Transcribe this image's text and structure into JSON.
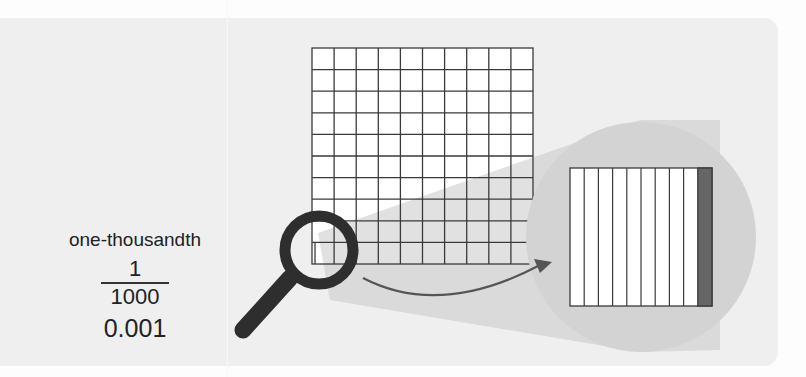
{
  "label": {
    "word": "one-thousandth",
    "fraction": {
      "numerator": "1",
      "denominator": "1000"
    },
    "decimal": "0.001"
  },
  "diagram": {
    "grid": {
      "rows": 10,
      "columns": 10,
      "description": "10x10 grid of hundredths"
    },
    "magnified_square": {
      "strips": 10,
      "shaded_strips": 1,
      "description": "one hundredth square divided into ten thousandths, one shaded"
    },
    "icons": [
      "magnifying-glass-icon",
      "curved-arrow-icon"
    ]
  },
  "colors": {
    "panel": "#efefef",
    "grid_line": "#3a3a3a",
    "magnifier": "#2e2e2e",
    "zoom_circle": "#d3d3d3",
    "shaded_strip": "#666666",
    "arrow": "#555555"
  }
}
